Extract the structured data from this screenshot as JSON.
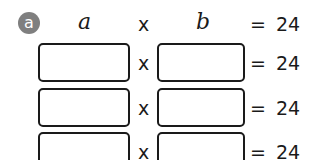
{
  "exercise": {
    "label": "a",
    "header": {
      "left_var": "a",
      "times": "x",
      "right_var": "b",
      "equals": "=",
      "product": "24"
    },
    "rows": [
      {
        "factor_a": "",
        "times": "x",
        "factor_b": "",
        "equals": "=",
        "product": "24"
      },
      {
        "factor_a": "",
        "times": "x",
        "factor_b": "",
        "equals": "=",
        "product": "24"
      },
      {
        "factor_a": "",
        "times": "x",
        "factor_b": "",
        "equals": "=",
        "product": "24"
      }
    ]
  },
  "colors": {
    "badge": "#7f7f7f",
    "text": "#1a1a1a",
    "box_border": "#1a1a1a"
  }
}
